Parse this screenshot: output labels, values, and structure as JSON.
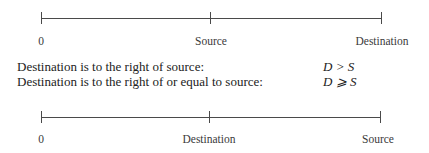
{
  "diagram_top": {
    "labels": {
      "zero": "0",
      "source": "Source",
      "destination": "Destination"
    }
  },
  "statements": [
    {
      "text": "Destination is to the right of source:",
      "expr": "D > S"
    },
    {
      "text": "Destination is to the right of or equal to source:",
      "expr": "D ⩾ S"
    }
  ],
  "diagram_bottom": {
    "labels": {
      "zero": "0",
      "destination": "Destination",
      "source": "Source"
    }
  }
}
